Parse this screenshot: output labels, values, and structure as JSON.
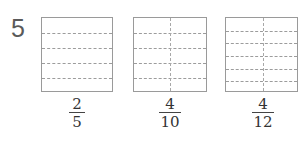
{
  "problem": {
    "number": "5"
  },
  "figures": [
    {
      "id": "fig-1",
      "rows": 5,
      "columns": 1,
      "fraction": {
        "numerator": "2",
        "denominator": "5"
      }
    },
    {
      "id": "fig-2",
      "rows": 5,
      "columns": 2,
      "fraction": {
        "numerator": "4",
        "denominator": "10"
      }
    },
    {
      "id": "fig-3",
      "rows": 6,
      "columns": 2,
      "fraction": {
        "numerator": "4",
        "denominator": "12"
      }
    }
  ],
  "colors": {
    "border": "#9a9a9a",
    "dashed_line": "#9c9c9c",
    "text": "#333333",
    "problem_number": "#5a5a5a"
  }
}
